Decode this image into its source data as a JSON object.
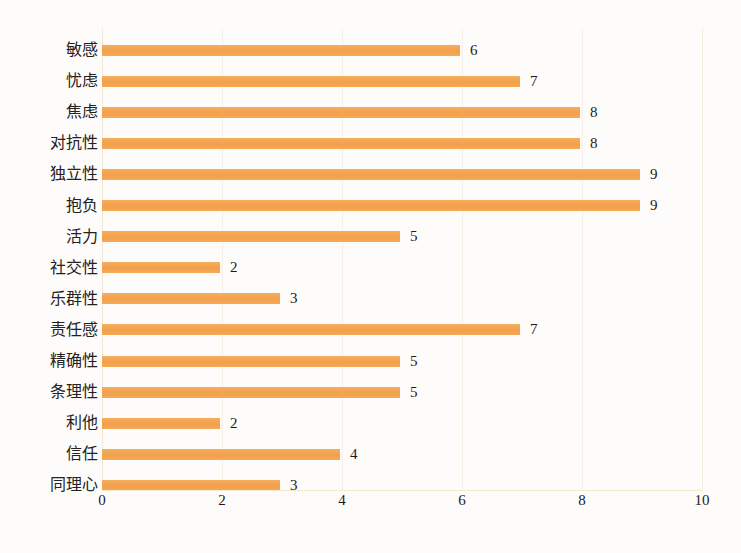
{
  "chart_data": {
    "type": "bar",
    "orientation": "horizontal",
    "title": "",
    "xlabel": "",
    "ylabel": "",
    "xlim": [
      0,
      10
    ],
    "xticks": [
      "0",
      "2",
      "4",
      "6",
      "8",
      "10"
    ],
    "grid": true,
    "legend": "none",
    "bar_color": "#f4a552",
    "background_color": "#fdfcfa",
    "gridline_color": "#f6f1e6",
    "categories": [
      "敏感",
      "忧虑",
      "焦虑",
      "对抗性",
      "独立性",
      "抱负",
      "活力",
      "社交性",
      "乐群性",
      "责任感",
      "精确性",
      "条理性",
      "利他",
      "信任",
      "同理心"
    ],
    "values": [
      6,
      7,
      8,
      8,
      9,
      9,
      5,
      2,
      3,
      7,
      5,
      5,
      2,
      4,
      3
    ],
    "value_labels": [
      "6",
      "7",
      "8",
      "8",
      "9",
      "9",
      "5",
      "2",
      "3",
      "7",
      "5",
      "5",
      "2",
      "4",
      "3"
    ]
  }
}
